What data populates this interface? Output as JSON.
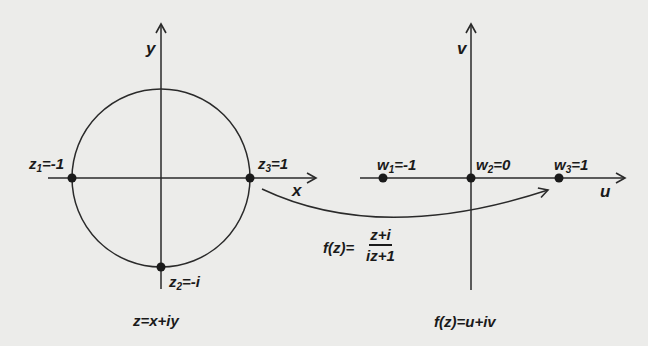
{
  "colors": {
    "background": "#ececea",
    "ink": "#1a1a1a",
    "line": "#2a2a2a"
  },
  "z_plane": {
    "x_axis_label": "x",
    "y_axis_label": "y",
    "points": [
      {
        "name": "z",
        "sub": "1",
        "value": "=-1"
      },
      {
        "name": "z",
        "sub": "2",
        "value": "=-i"
      },
      {
        "name": "z",
        "sub": "3",
        "value": "=1"
      }
    ],
    "caption": "z=x+iy"
  },
  "w_plane": {
    "u_axis_label": "u",
    "v_axis_label": "v",
    "points": [
      {
        "name": "w",
        "sub": "1",
        "value": "=-1"
      },
      {
        "name": "w",
        "sub": "2",
        "value": "=0"
      },
      {
        "name": "w",
        "sub": "3",
        "value": "=1"
      }
    ],
    "caption": "f(z)=u+iv"
  },
  "mapping": {
    "lhs": "f(z)=",
    "numerator": "z+i",
    "denominator": "iz+1"
  }
}
